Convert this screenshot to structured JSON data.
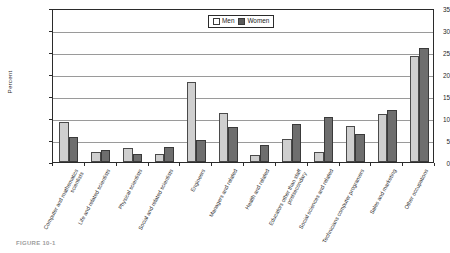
{
  "chart_data": {
    "type": "bar",
    "title": "",
    "xlabel": "",
    "ylabel": "Percent",
    "ylim": [
      0,
      35
    ],
    "ytick_step": 5,
    "yticks": [
      "0",
      "5",
      "10",
      "15",
      "20",
      "25",
      "30",
      "35"
    ],
    "grid": true,
    "legend_position": "top-center",
    "categories": [
      "Computer and mathematics scientists",
      "Life and related scientists",
      "Physical scientists",
      "Social and related scientists",
      "Engineers",
      "Managers and related",
      "Health and related",
      "Educators other than staff postsecondary",
      "Social sciences and related",
      "Technicians computer programers",
      "Sales and marketing",
      "Other occupations"
    ],
    "series": [
      {
        "name": "Men",
        "color": "#cfcfcf",
        "values": [
          9.2,
          2.2,
          3.2,
          1.9,
          18.2,
          11.1,
          1.6,
          5.2,
          2.3,
          8.2,
          11.0,
          24.0
        ]
      },
      {
        "name": "Women",
        "color": "#6e6e6e",
        "values": [
          5.7,
          2.8,
          1.9,
          3.3,
          5.0,
          8.0,
          3.9,
          8.7,
          10.3,
          6.4,
          11.9,
          26.0
        ]
      }
    ]
  },
  "legend": {
    "entries": [
      {
        "label": "Men"
      },
      {
        "label": "Women"
      }
    ]
  },
  "caption": {
    "text": "FIGURE 10-1"
  }
}
